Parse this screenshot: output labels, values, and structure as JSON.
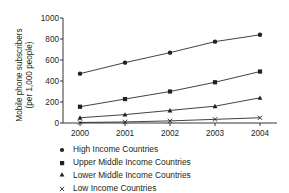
{
  "chart_data": {
    "type": "line",
    "title": "",
    "subtitle": "",
    "xlabel": "",
    "ylabel": "Mobile phone subscribers (per 1,000 people)",
    "ylabel_line1": "Mobile phone subscribers",
    "ylabel_line2": "(per 1,000 people)",
    "categories": [
      "2000",
      "2001",
      "2002",
      "2003",
      "2004"
    ],
    "x": [
      2000,
      2001,
      2002,
      2003,
      2004
    ],
    "xlim": [
      2000,
      2004
    ],
    "ylim": [
      0,
      1000
    ],
    "ytick_labels": [
      "0",
      "200",
      "400",
      "600",
      "800",
      "1000"
    ],
    "yticks": [
      0,
      200,
      400,
      600,
      800,
      1000
    ],
    "xtick_labels": [
      "2000",
      "2001",
      "2002",
      "2003",
      "2004"
    ],
    "grid": false,
    "legend_position": "below",
    "series": [
      {
        "name": "High Income Countries",
        "marker": "circle",
        "values": [
          470,
          575,
          670,
          775,
          840
        ]
      },
      {
        "name": "Upper Middle Income Countries",
        "marker": "square",
        "values": [
          155,
          228,
          300,
          388,
          490
        ]
      },
      {
        "name": "Lower Middle Income Countries",
        "marker": "triangle",
        "values": [
          50,
          80,
          120,
          160,
          240
        ]
      },
      {
        "name": "Low Income Countries",
        "marker": "x",
        "values": [
          5,
          10,
          20,
          35,
          50
        ]
      }
    ]
  },
  "legend": {
    "items": [
      {
        "label": "High Income Countries",
        "marker": "circle"
      },
      {
        "label": "Upper Middle Income Countries",
        "marker": "square"
      },
      {
        "label": "Lower Middle Income Countries",
        "marker": "triangle"
      },
      {
        "label": "Low Income Countries",
        "marker": "x"
      }
    ]
  },
  "colors": {
    "ink": "#231f20",
    "background": "#ffffff"
  }
}
